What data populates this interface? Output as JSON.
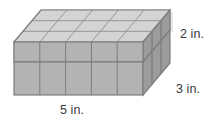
{
  "figure": {
    "kind": "rectangular-prism-with-unit-cubes",
    "labels": {
      "width": "5 in.",
      "depth": "3 in.",
      "height": "2 in."
    },
    "dimensions": {
      "width_units": 5,
      "depth_units": 3,
      "height_units": 2
    },
    "cube_layer": {
      "columns": 5,
      "rows": 3,
      "layers_filled": 1
    },
    "colors": {
      "cube_top_face": "#d4d4d4",
      "cube_front_face": "#b3b3b3",
      "cube_right_face": "#9c9c9c",
      "cube_edge": "#7d7d7d",
      "wireframe_edge": "#a8a8a8",
      "hidden_edge_dashed": "#b8b8b8",
      "label_text": "#3a3a3a",
      "background": "#ffffff"
    }
  }
}
